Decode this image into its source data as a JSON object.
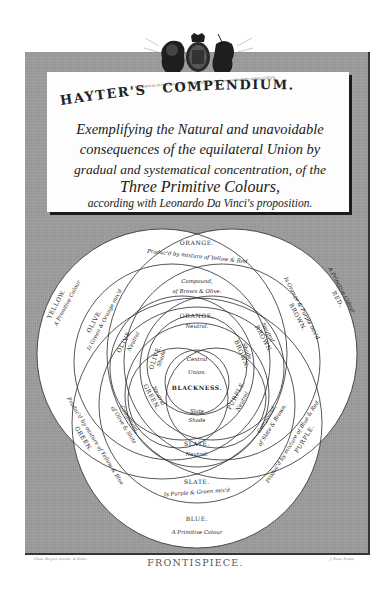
{
  "plate": {
    "title": "HAYTER'S COMPENDIUM.",
    "title_first": "HAYTER'S",
    "title_second": "COMPENDIUM.",
    "subtitle_lines": [
      "Exemplifying the Natural and unavoidable",
      "consequences of the equilateral Union by",
      "gradual and systematical concentration, of the",
      "Three Primitive Colours,",
      "according with Leonardo Da Vinci's proposition."
    ],
    "dedication": "Dedicated by Permission to Her Royal Highness the Princess Charlotte of Saxe Coburg",
    "caption": "FRONTISPIECE.",
    "footer_left": "Chas. Hayter, Invent. & Delin.",
    "footer_right": "J. Pass, Sculp.",
    "crest_icon": "royal-coat-of-arms-icon"
  },
  "diagram": {
    "colors": {
      "frame_gray": "#9d9d9d",
      "paper": "#ffffff",
      "line": "#2a2a2a"
    },
    "primaries": {
      "yellow": {
        "name": "YELLOW.",
        "note": "A Primitive Colour"
      },
      "red": {
        "name": "RED.",
        "note": "A Primitive Colour"
      },
      "blue": {
        "name": "BLUE.",
        "note": "A Primitive Colour"
      }
    },
    "secondaries": {
      "orange": {
        "name": "ORANGE.",
        "note": "Produc'd by mixture of Yellow & Red"
      },
      "green": {
        "name": "GREEN.",
        "note": "Produc'd by mixture of Yellow & Blue"
      },
      "purple": {
        "name": "PURPLE.",
        "note": "Produc'd by mixture of Blue & Red."
      }
    },
    "tertiaries": {
      "olive": {
        "name": "OLIVE.",
        "note": "Is Green & Orange mix'd"
      },
      "brown": {
        "name": "BROWN.",
        "note": "Is Orange & Purple mix'd"
      },
      "slate": {
        "name": "SLATE.",
        "note": "Is Purple & Green mix'd"
      }
    },
    "compounds": {
      "top": {
        "name": "Compound,",
        "note": "of Brown & Olive."
      },
      "left": {
        "name": "Compound,",
        "note": "of Olive & Slate"
      },
      "right": {
        "name": "Compound,",
        "note": "of Slate & Brown."
      }
    },
    "neutrals": {
      "orange": {
        "name": "ORANGE,",
        "note": "Neutral."
      },
      "olive": {
        "name": "OLIVE.",
        "note": "Neutral"
      },
      "brown": {
        "name": "BROWN.",
        "note": "Neutral"
      },
      "green": {
        "name": "GREEN.",
        "note": "Neutral"
      },
      "purple": {
        "name": "PURPLE.",
        "note": "Neutral."
      },
      "slate": {
        "name": "SLATE.",
        "note": "Neutral."
      }
    },
    "shades": {
      "olive": {
        "name": "OLIVE.",
        "note": "Shade"
      },
      "brown": {
        "name": "BROWN.",
        "note": "Shade"
      },
      "slate": {
        "name": "Slate",
        "note": "Shade"
      }
    },
    "center": {
      "line1": "Central",
      "line2": "Union.",
      "line3": "BLACKNESS."
    }
  }
}
